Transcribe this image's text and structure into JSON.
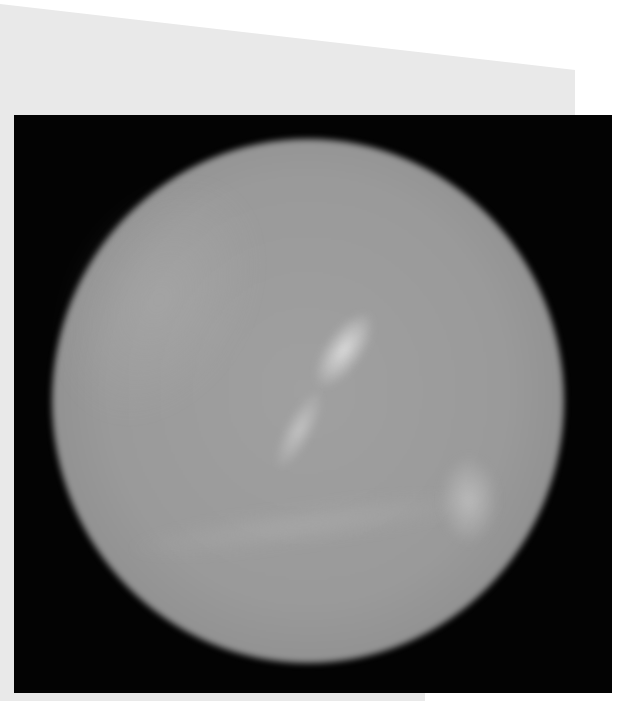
{
  "image": {
    "subject": "planet-neptune-grayscale",
    "description": "Grayscale telescope image of a planet disc on a black square background, mounted on a light gray sheet",
    "colors": {
      "background_sheet": "#e9e9e9",
      "frame": "#030303",
      "planet_disc": "#9a9a9a",
      "bright_features": "#e1e1e1"
    }
  }
}
